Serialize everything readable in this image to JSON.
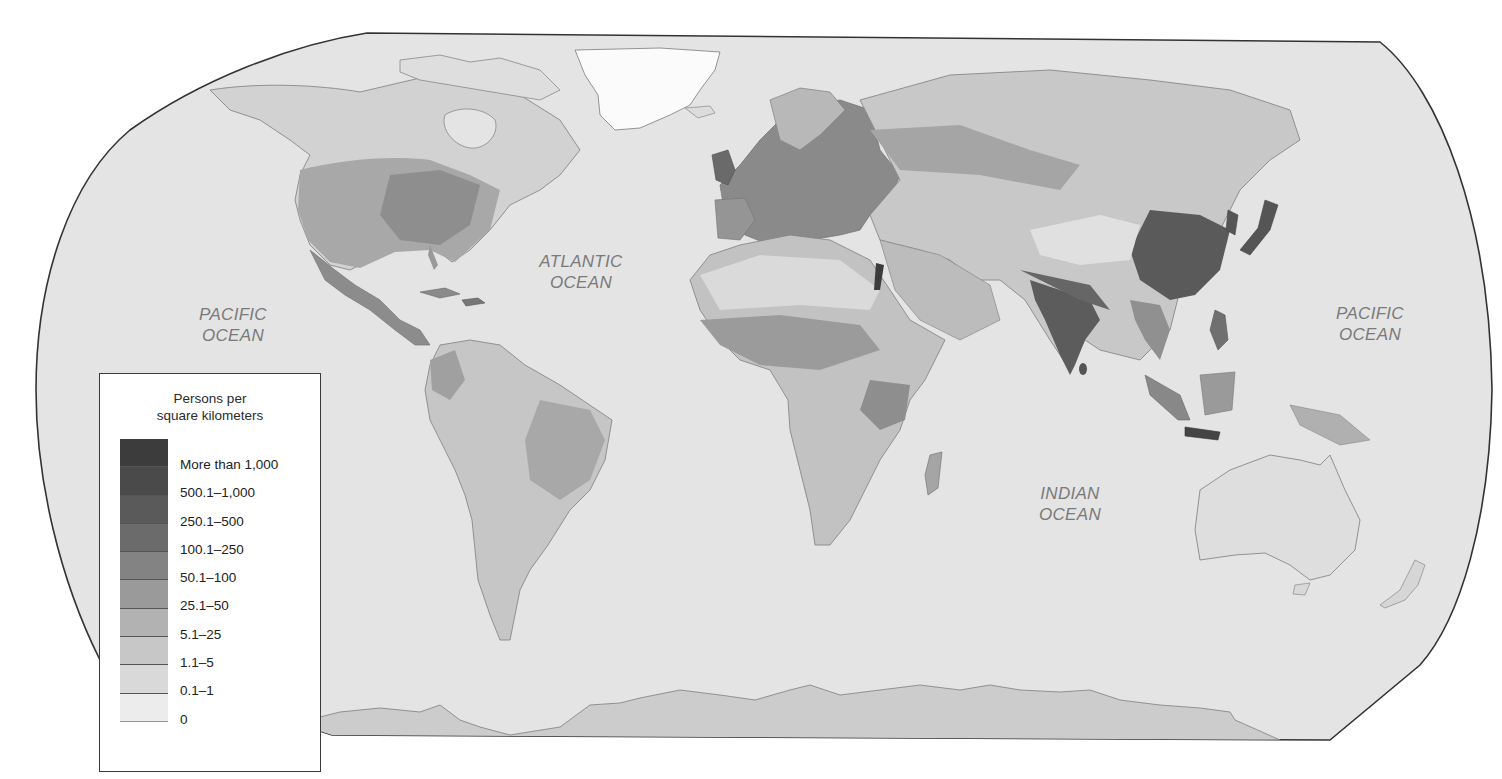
{
  "map": {
    "projection_shape": "Robinson-like world outline",
    "ocean_color": "#e4e4e4",
    "border_color": "#333333",
    "ocean_labels": [
      {
        "id": "pacific-west",
        "line1": "PACIFIC",
        "line2": "OCEAN"
      },
      {
        "id": "atlantic",
        "line1": "ATLANTIC",
        "line2": "OCEAN"
      },
      {
        "id": "pacific-east",
        "line1": "PACIFIC",
        "line2": "OCEAN"
      },
      {
        "id": "indian",
        "line1": "INDIAN",
        "line2": "OCEAN"
      }
    ]
  },
  "legend": {
    "title_line1": "Persons per",
    "title_line2": "square kilometers",
    "classes": [
      {
        "label": "More than 1,000",
        "color": "#3c3c3c"
      },
      {
        "label": "500.1–1,000",
        "color": "#4a4a4a"
      },
      {
        "label": "250.1–500",
        "color": "#5a5a5a"
      },
      {
        "label": "100.1–250",
        "color": "#6b6b6b"
      },
      {
        "label": "50.1–100",
        "color": "#838383"
      },
      {
        "label": "25.1–50",
        "color": "#9a9a9a"
      },
      {
        "label": "5.1–25",
        "color": "#b2b2b2"
      },
      {
        "label": "1.1–5",
        "color": "#c7c7c7"
      },
      {
        "label": "0.1–1",
        "color": "#d9d9d9"
      },
      {
        "label": "0",
        "color": "#ececec"
      }
    ]
  }
}
